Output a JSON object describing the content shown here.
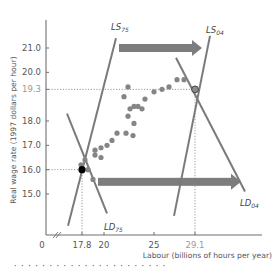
{
  "chart_data": {
    "type": "scatter",
    "title": "",
    "xlabel": "Labour (billions of hours per year)",
    "ylabel": "Real wage rate (1997 dollars per hour)",
    "x_axis": {
      "origin_label": "0",
      "axis_break": true,
      "ticks": [
        17.8,
        20,
        25,
        29.1
      ],
      "tick_labels": [
        "17.8",
        "20",
        "25",
        "29.1"
      ],
      "range": [
        15.5,
        33
      ]
    },
    "y_axis": {
      "axis_break": true,
      "ticks": [
        15.0,
        16.0,
        17.0,
        18.0,
        19.3,
        20.0,
        21.0
      ],
      "tick_labels": [
        "15.0",
        "16.0",
        "17.0",
        "18.0",
        "19.3",
        "20.0",
        "21.0"
      ],
      "range": [
        13.3,
        22.2
      ]
    },
    "grid": false,
    "curves": [
      {
        "name": "LS75",
        "label_main": "LS",
        "label_sub": "75",
        "type": "supply",
        "points": [
          [
            16.4,
            13.7
          ],
          [
            21.2,
            21.4
          ]
        ]
      },
      {
        "name": "LD75",
        "label_main": "LD",
        "label_sub": "75",
        "type": "demand",
        "points": [
          [
            16.3,
            18.3
          ],
          [
            20.3,
            14.2
          ]
        ]
      },
      {
        "name": "LS04",
        "label_main": "LS",
        "label_sub": "04",
        "type": "supply",
        "points": [
          [
            27.0,
            14.1
          ],
          [
            30.6,
            21.5
          ]
        ]
      },
      {
        "name": "LD04",
        "label_main": "LD",
        "label_sub": "04",
        "type": "demand",
        "points": [
          [
            27.2,
            20.6
          ],
          [
            34.1,
            15.1
          ]
        ]
      }
    ],
    "equilibria": [
      {
        "label": "1975",
        "x": 17.8,
        "y": 16.0,
        "style": "black dot"
      },
      {
        "label": "2004",
        "x": 29.1,
        "y": 19.3,
        "style": "grey circle"
      }
    ],
    "shift_arrows": [
      {
        "curve": "supply",
        "from_x": 21.5,
        "to_x": 29.8,
        "y": 21.0
      },
      {
        "curve": "demand",
        "from_x": 19.4,
        "to_x": 33.7,
        "y": 15.5
      }
    ],
    "scatter_points": [
      [
        17.7,
        16.2
      ],
      [
        18.1,
        16.4
      ],
      [
        18.4,
        16.0
      ],
      [
        18.9,
        15.6
      ],
      [
        19.1,
        16.8
      ],
      [
        19.7,
        16.9
      ],
      [
        19.1,
        16.6
      ],
      [
        19.7,
        16.5
      ],
      [
        20.3,
        17.0
      ],
      [
        20.8,
        17.2
      ],
      [
        21.3,
        17.5
      ],
      [
        22.2,
        17.5
      ],
      [
        22.9,
        17.4
      ],
      [
        23.0,
        17.9
      ],
      [
        22.4,
        18.2
      ],
      [
        22.6,
        18.5
      ],
      [
        23.0,
        18.6
      ],
      [
        23.4,
        18.6
      ],
      [
        23.8,
        18.5
      ],
      [
        22.0,
        19.0
      ],
      [
        22.4,
        19.4
      ],
      [
        24.1,
        18.9
      ],
      [
        25.0,
        19.2
      ],
      [
        25.8,
        19.3
      ],
      [
        26.5,
        19.4
      ],
      [
        27.3,
        19.7
      ],
      [
        28.0,
        19.7
      ]
    ],
    "reference_lines": [
      {
        "axis": "y",
        "value": 19.3,
        "to_x": 29.1,
        "style": "dotted"
      },
      {
        "axis": "y",
        "value": 16.0,
        "to_x": 17.8,
        "style": "dotted"
      },
      {
        "axis": "x",
        "value": 17.8,
        "to_y": 16.0,
        "style": "dotted"
      },
      {
        "axis": "x",
        "value": 29.1,
        "to_y": 19.3,
        "style": "dotted"
      }
    ],
    "colors": {
      "curves": "#7a7a7a",
      "arrows": "#7d7d7d",
      "points": "#858585",
      "axis": "#6f6f6f",
      "equilibrium_1975": "#000000",
      "equilibrium_2004": "#8c8c8c"
    }
  },
  "caption": "· · · · · · · · · · · · · · · · · · · · · ·"
}
